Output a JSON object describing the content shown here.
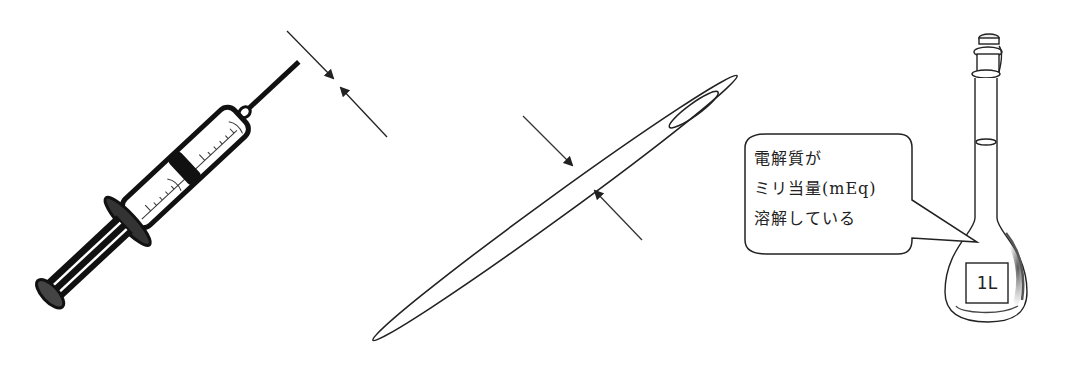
{
  "figure": {
    "panels": [
      {
        "id": "syringe",
        "description": "syringe with needle gauge measurement arrows"
      },
      {
        "id": "needle-closeup",
        "description": "magnified needle with diameter arrows"
      },
      {
        "id": "volumetric-flask",
        "description": "1 liter volumetric flask with speech bubble"
      }
    ]
  },
  "callout": {
    "lines": [
      "電解質が",
      "ミリ当量(mEq)",
      "溶解している"
    ]
  },
  "flask": {
    "label": "1L"
  },
  "colors": {
    "ink": "#111111",
    "line": "#333333",
    "shade": "#555555",
    "background": "#ffffff"
  }
}
